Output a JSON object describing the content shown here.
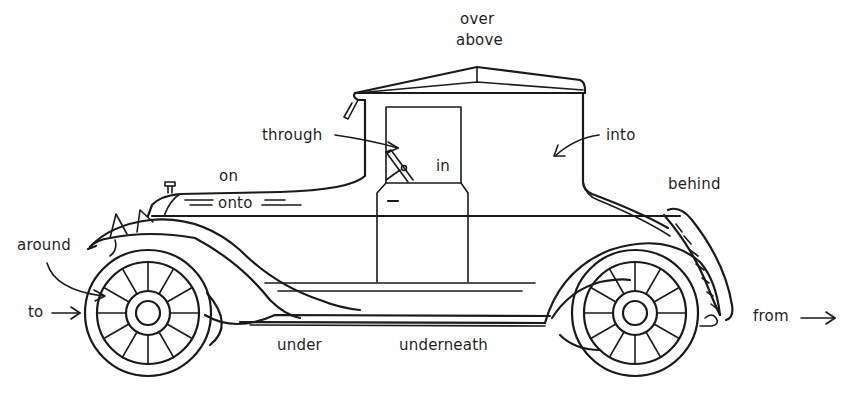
{
  "diagram": {
    "line_color": "#1a1a1a",
    "background": "#ffffff",
    "labels": {
      "over": "over",
      "above": "above",
      "through": "through",
      "in": "in",
      "into": "into",
      "on": "on",
      "onto": "onto",
      "behind": "behind",
      "around": "around",
      "to": "to",
      "under": "under",
      "underneath": "underneath",
      "from": "from"
    }
  }
}
